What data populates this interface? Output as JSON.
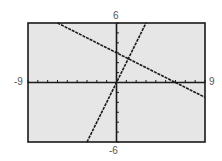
{
  "chart_data": {
    "type": "line",
    "title": "",
    "xlabel": "",
    "ylabel": "",
    "xlim": [
      -9,
      9
    ],
    "ylim": [
      -6,
      6
    ],
    "xscale": 1,
    "yscale": 1,
    "grid": false,
    "axis_labels": {
      "xmin": "-9",
      "xmax": "9",
      "ymin": "-6",
      "ymax": "6"
    },
    "series": [
      {
        "name": "line-decreasing",
        "equation": "y = -0.5x + 3",
        "slope": -0.5,
        "intercept": 3,
        "x": [
          -6,
          9
        ],
        "y": [
          6,
          -1.5
        ]
      },
      {
        "name": "line-steep",
        "equation": "y = 2x",
        "slope": 2,
        "intercept": 0,
        "x": [
          -3,
          3
        ],
        "y": [
          -6,
          6
        ]
      }
    ],
    "annotations": [
      {
        "type": "intersection",
        "x": 1.2,
        "y": 2.4
      }
    ]
  },
  "style": {
    "background": "#e6e6e6",
    "frame": "#1a1a1a",
    "line": "#1a1a1a",
    "label": "#555555"
  }
}
